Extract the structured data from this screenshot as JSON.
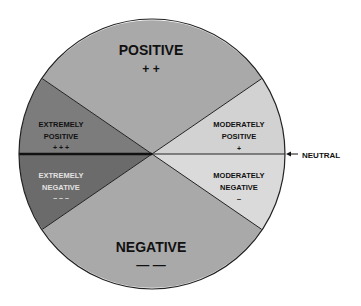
{
  "diagram": {
    "type": "pie-scale",
    "colors": {
      "positive": "#a9a9a9",
      "negative": "#a9a9a9",
      "extremely_positive": "#7c7c7c",
      "extremely_negative": "#6b6b6b",
      "moderately_positive": "#d2d2d2",
      "moderately_negative": "#dadada",
      "outline": "#222222",
      "dark_text": "#111111",
      "light_text": "#e2e2e2"
    },
    "segments": {
      "positive": {
        "label": "POSITIVE",
        "symbol": "+ +"
      },
      "negative": {
        "label": "NEGATIVE",
        "symbol": "— —"
      },
      "extremely_positive": {
        "line1": "EXTREMELY",
        "line2": "POSITIVE",
        "symbol": "+ + +"
      },
      "extremely_negative": {
        "line1": "EXTREMELY",
        "line2": "NEGATIVE",
        "symbol": "– – –"
      },
      "moderately_positive": {
        "line1": "MODERATELY",
        "line2": "POSITIVE",
        "symbol": "+"
      },
      "moderately_negative": {
        "line1": "MODERATELY",
        "line2": "NEGATIVE",
        "symbol": "–"
      }
    },
    "neutral": {
      "label": "NEUTRAL",
      "arrow": "←"
    }
  }
}
